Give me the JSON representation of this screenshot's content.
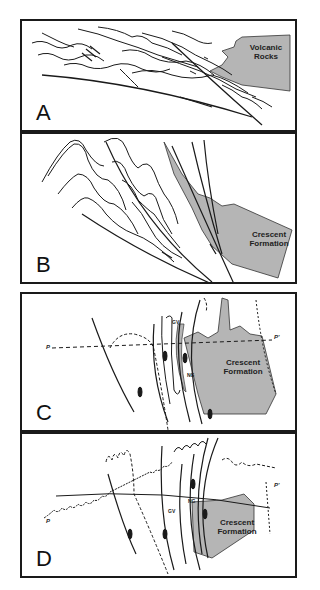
{
  "figure": {
    "panels": [
      {
        "label": "A",
        "units": [
          "Volcanic Rocks"
        ]
      },
      {
        "label": "B",
        "units": [
          "Crescent Formation"
        ]
      },
      {
        "label": "C",
        "units": [
          "Crescent Formation"
        ],
        "annotations": [
          "GV",
          "NG"
        ],
        "section_line": {
          "start": "P",
          "end": "P'"
        }
      },
      {
        "label": "D",
        "units": [
          "Crescent Formation"
        ],
        "annotations": [
          "GV",
          "NG"
        ],
        "section_line": {
          "start": "P",
          "end": "P'"
        }
      }
    ]
  },
  "colors": {
    "unit_fill": "#b5b5b5",
    "line": "#1a1a1a",
    "frame": "#1a1a1a"
  }
}
